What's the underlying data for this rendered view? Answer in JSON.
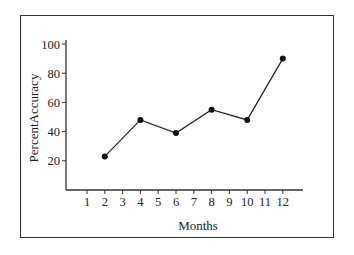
{
  "chart_data": {
    "type": "line",
    "title": "",
    "xlabel": "Months",
    "ylabel": "PercentAccuracy",
    "x_ticks": [
      "1",
      "2",
      "3",
      "4",
      "5",
      "6",
      "7",
      "8",
      "9",
      "10",
      "11",
      "12"
    ],
    "y_ticks": [
      "20",
      "40",
      "60",
      "80",
      "100"
    ],
    "xlim": [
      0,
      13
    ],
    "ylim": [
      0,
      100
    ],
    "grid": false,
    "legend": null,
    "series": [
      {
        "name": "PercentAccuracy",
        "x": [
          2,
          4,
          6,
          8,
          10,
          12
        ],
        "values": [
          23,
          48,
          39,
          55,
          48,
          90
        ]
      }
    ]
  }
}
